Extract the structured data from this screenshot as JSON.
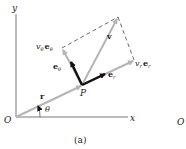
{
  "figure": {
    "caption": "(a)",
    "axes": {
      "x_label": "x",
      "y_label": "y",
      "origin_label": "O"
    },
    "angle_label": "θ",
    "point_label": "P",
    "position_vector_label": "r",
    "velocity_label": "v",
    "unit_vectors": {
      "radial": "e",
      "radial_sub": "r",
      "transverse": "e",
      "transverse_sub": "θ"
    },
    "components": {
      "radial": {
        "coef": "v",
        "coef_sub": "r",
        "vec": "e",
        "vec_sub": "r"
      },
      "transverse": {
        "coef": "v",
        "coef_sub": "θ",
        "vec": "e",
        "vec_sub": "θ"
      }
    },
    "cropped_next_figure_label": "O",
    "colors": {
      "axes": "#555555",
      "gray_vectors": "#b5b5b5",
      "unit_vectors": "#111111",
      "dashed": "#444444"
    }
  }
}
